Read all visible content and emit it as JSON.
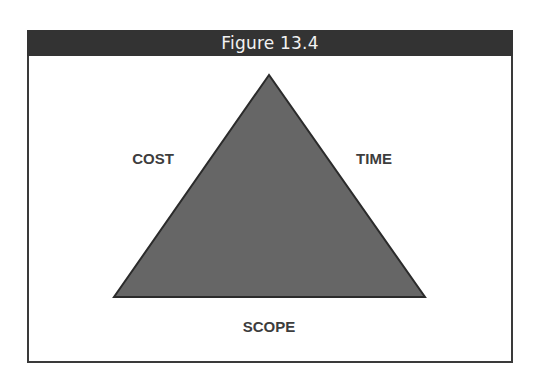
{
  "figure": {
    "title": "Figure 13.4",
    "header_color": "#333333",
    "triangle_fill": "#666666",
    "triangle_stroke": "#2b2b2b",
    "label_color": "#3d3d3d"
  },
  "diagram": {
    "type": "project-management-triangle",
    "labels": {
      "left_side": "COST",
      "right_side": "TIME",
      "base": "SCOPE"
    }
  }
}
